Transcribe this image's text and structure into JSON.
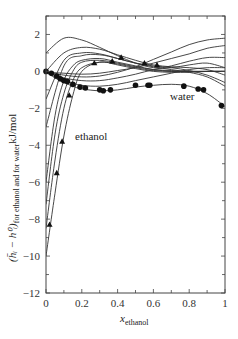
{
  "chart_data": {
    "type": "line",
    "title": "",
    "xlabel": "x_ethanol",
    "xlabel_main": "x",
    "xlabel_sub": "ethanol",
    "ylabel": "(h̄ᵢ − h⁰ᵢ) for ethanol and for water kJ/mol",
    "ylabel_main": "(h̄ᵢ − h⁰ᵢ)",
    "ylabel_sub": "for ethanol and for water",
    "ylabel_unit": "kJ/mol",
    "xlim": [
      0,
      1
    ],
    "ylim": [
      -12,
      3
    ],
    "grid": false,
    "legend": "none",
    "x_ticks": [
      "0",
      "0.2",
      "0.4",
      "0.6",
      "0.8",
      "1"
    ],
    "y_ticks": [
      "2",
      "0",
      "-2",
      "-4",
      "-6",
      "-8",
      "-10",
      "-12"
    ],
    "annotations": [
      {
        "text": "water",
        "x": 0.75,
        "y": -1.5
      },
      {
        "text": "ethanol",
        "x": 0.12,
        "y": -3.8
      }
    ],
    "series": [
      {
        "name": "ethanol curve 1 (fit)",
        "x": [
          0,
          0.05,
          0.1,
          0.15,
          0.2,
          0.3,
          0.4,
          0.5,
          0.6,
          0.7,
          0.8,
          0.9,
          1.0
        ],
        "y": [
          -10.0,
          -6.6,
          -3.5,
          -1.3,
          0.0,
          0.5,
          0.35,
          0.15,
          0.0,
          -0.05,
          -0.05,
          0.0,
          0.0
        ]
      },
      {
        "name": "ethanol curve 2",
        "x": [
          0,
          0.05,
          0.1,
          0.15,
          0.2,
          0.3,
          0.4,
          0.5,
          0.6,
          0.7,
          0.8,
          0.9,
          1.0
        ],
        "y": [
          -8.5,
          -4.8,
          -2.0,
          -0.5,
          0.2,
          0.5,
          0.4,
          0.2,
          0.05,
          0.0,
          0.0,
          0.0,
          0.0
        ]
      },
      {
        "name": "ethanol curve 3",
        "x": [
          0,
          0.05,
          0.1,
          0.15,
          0.2,
          0.3,
          0.4,
          0.5,
          0.6,
          0.7,
          0.8,
          0.9,
          1.0
        ],
        "y": [
          -7.2,
          -3.4,
          -1.2,
          0.0,
          0.5,
          0.6,
          0.45,
          0.25,
          0.1,
          0.0,
          0.0,
          0.0,
          0.0
        ]
      },
      {
        "name": "ethanol curve 4",
        "x": [
          0,
          0.05,
          0.1,
          0.15,
          0.2,
          0.3,
          0.4,
          0.5,
          0.6,
          0.7,
          0.8,
          0.9,
          1.0
        ],
        "y": [
          -6.0,
          -2.4,
          -0.5,
          0.3,
          0.6,
          0.7,
          0.5,
          0.3,
          0.1,
          0.05,
          0.0,
          0.0,
          0.0
        ]
      },
      {
        "name": "mixed curve A",
        "x": [
          0,
          0.1,
          0.2,
          0.3,
          0.4,
          0.5,
          0.6,
          0.7,
          0.8,
          0.9,
          1.0
        ],
        "y": [
          -3.0,
          0.3,
          0.85,
          0.9,
          0.7,
          0.45,
          0.25,
          0.1,
          -0.05,
          -0.3,
          -0.8
        ]
      },
      {
        "name": "mixed curve B",
        "x": [
          0,
          0.1,
          0.2,
          0.3,
          0.4,
          0.5,
          0.6,
          0.7,
          0.8,
          0.9,
          1.0
        ],
        "y": [
          -1.5,
          0.6,
          1.0,
          0.95,
          0.7,
          0.45,
          0.3,
          0.2,
          0.05,
          -0.2,
          -0.6
        ]
      },
      {
        "name": "mixed curve C",
        "x": [
          0,
          0.1,
          0.2,
          0.3,
          0.4,
          0.5,
          0.6,
          0.7,
          0.8,
          0.9,
          1.0
        ],
        "y": [
          0.0,
          1.0,
          1.3,
          1.2,
          0.9,
          0.6,
          0.35,
          0.25,
          0.2,
          0.1,
          -0.2
        ]
      },
      {
        "name": "mixed curve D",
        "x": [
          0,
          0.1,
          0.2,
          0.3,
          0.4,
          0.5,
          0.6,
          0.7,
          0.8,
          0.9,
          1.0
        ],
        "y": [
          1.0,
          1.8,
          1.7,
          1.3,
          0.85,
          0.45,
          0.2,
          0.2,
          0.35,
          0.45,
          0.2
        ]
      },
      {
        "name": "water curve 1",
        "x": [
          0,
          0.1,
          0.2,
          0.3,
          0.4,
          0.5,
          0.6,
          0.7,
          0.8,
          0.9,
          1.0
        ],
        "y": [
          -0.05,
          -0.1,
          -0.15,
          -0.1,
          0.05,
          0.2,
          0.45,
          0.7,
          0.95,
          1.25,
          1.4
        ]
      },
      {
        "name": "water curve 2",
        "x": [
          0,
          0.1,
          0.2,
          0.3,
          0.4,
          0.5,
          0.6,
          0.7,
          0.8,
          0.9,
          1.0
        ],
        "y": [
          -0.05,
          -0.2,
          -0.3,
          -0.25,
          -0.05,
          0.25,
          0.65,
          1.05,
          1.45,
          1.7,
          1.8
        ]
      },
      {
        "name": "water curve 3",
        "x": [
          0,
          0.1,
          0.2,
          0.3,
          0.4,
          0.5,
          0.6,
          0.7,
          0.8,
          0.9,
          1.0
        ],
        "y": [
          -0.05,
          -0.35,
          -0.5,
          -0.5,
          -0.35,
          -0.15,
          0.1,
          0.3,
          0.55,
          0.75,
          0.75
        ]
      },
      {
        "name": "water curve 4",
        "x": [
          0,
          0.1,
          0.2,
          0.3,
          0.4,
          0.5,
          0.6,
          0.7,
          0.8,
          0.9,
          1.0
        ],
        "y": [
          -0.05,
          -0.5,
          -0.75,
          -0.8,
          -0.7,
          -0.5,
          -0.3,
          -0.1,
          0.1,
          0.2,
          0.2
        ]
      },
      {
        "name": "water curve (fit)",
        "x": [
          0,
          0.05,
          0.1,
          0.15,
          0.2,
          0.3,
          0.4,
          0.5,
          0.6,
          0.7,
          0.8,
          0.9,
          1.0
        ],
        "y": [
          -0.05,
          -0.35,
          -0.6,
          -0.8,
          -0.95,
          -1.05,
          -1.0,
          -0.85,
          -0.75,
          -0.7,
          -0.8,
          -1.2,
          -1.9
        ]
      },
      {
        "name": "ethanol data (triangles)",
        "marker": "triangle",
        "x": [
          0.02,
          0.06,
          0.09,
          0.13,
          0.27,
          0.37,
          0.42,
          0.55,
          0.62
        ],
        "y": [
          -8.3,
          -5.5,
          -3.8,
          -1.3,
          0.45,
          0.55,
          0.75,
          0.45,
          0.35
        ]
      },
      {
        "name": "water data (circles)",
        "marker": "circle",
        "x": [
          0.0,
          0.03,
          0.06,
          0.08,
          0.1,
          0.12,
          0.15,
          0.19,
          0.22,
          0.3,
          0.32,
          0.36,
          0.5,
          0.57,
          0.58,
          0.77,
          0.85,
          0.88,
          0.98
        ],
        "y": [
          0.0,
          -0.1,
          -0.25,
          -0.4,
          -0.5,
          -0.55,
          -0.7,
          -0.85,
          -0.9,
          -1.0,
          -1.05,
          -1.0,
          -0.75,
          -0.75,
          -0.75,
          -0.8,
          -0.95,
          -1.0,
          -1.85
        ]
      }
    ]
  }
}
